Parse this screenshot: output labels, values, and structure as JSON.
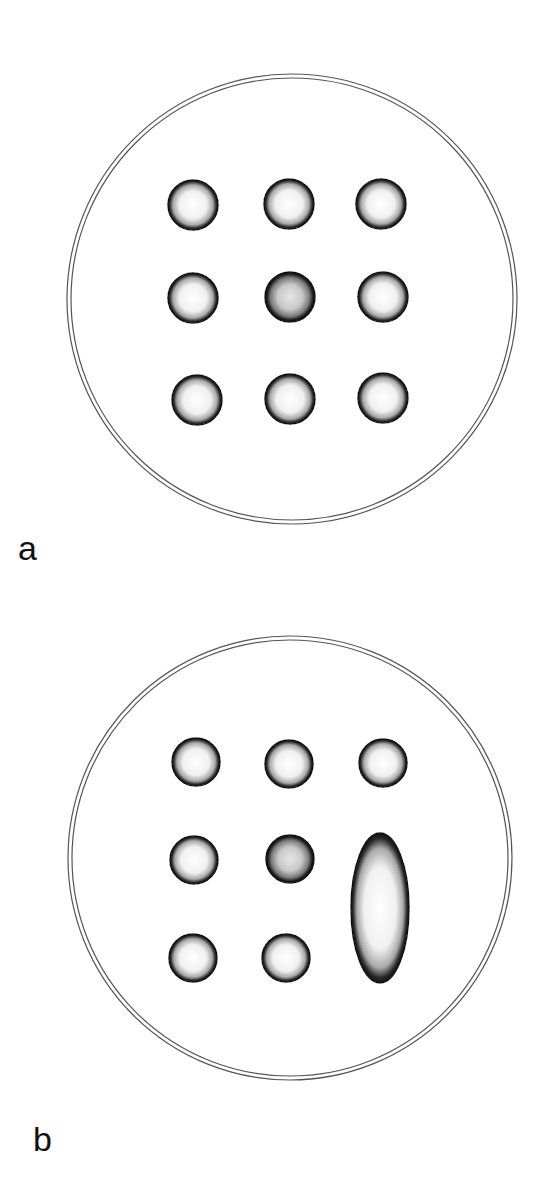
{
  "figure": {
    "panels": [
      {
        "label": "a",
        "dish": {
          "cx": 292,
          "cy": 299,
          "r": 225
        },
        "spots": [
          {
            "cx": 193,
            "cy": 205,
            "rx": 25,
            "ry": 25,
            "shade": "light"
          },
          {
            "cx": 289,
            "cy": 204,
            "rx": 25,
            "ry": 25,
            "shade": "light"
          },
          {
            "cx": 381,
            "cy": 204,
            "rx": 25,
            "ry": 25,
            "shade": "light"
          },
          {
            "cx": 193,
            "cy": 298,
            "rx": 25,
            "ry": 25,
            "shade": "light"
          },
          {
            "cx": 290,
            "cy": 297,
            "rx": 25,
            "ry": 25,
            "shade": "dark"
          },
          {
            "cx": 383,
            "cy": 297,
            "rx": 25,
            "ry": 25,
            "shade": "light"
          },
          {
            "cx": 197,
            "cy": 400,
            "rx": 25,
            "ry": 25,
            "shade": "light"
          },
          {
            "cx": 290,
            "cy": 399,
            "rx": 25,
            "ry": 25,
            "shade": "light"
          },
          {
            "cx": 383,
            "cy": 398,
            "rx": 25,
            "ry": 25,
            "shade": "light"
          }
        ]
      },
      {
        "label": "b",
        "dish": {
          "cx": 290,
          "cy": 858,
          "r": 222
        },
        "spots": [
          {
            "cx": 196,
            "cy": 762,
            "rx": 24,
            "ry": 24,
            "shade": "light"
          },
          {
            "cx": 289,
            "cy": 764,
            "rx": 24,
            "ry": 24,
            "shade": "light"
          },
          {
            "cx": 383,
            "cy": 763,
            "rx": 24,
            "ry": 24,
            "shade": "light"
          },
          {
            "cx": 194,
            "cy": 860,
            "rx": 24,
            "ry": 24,
            "shade": "light"
          },
          {
            "cx": 290,
            "cy": 859,
            "rx": 24,
            "ry": 24,
            "shade": "dark"
          },
          {
            "cx": 380,
            "cy": 908,
            "rx": 29,
            "ry": 75,
            "shade": "light"
          },
          {
            "cx": 193,
            "cy": 958,
            "rx": 24,
            "ry": 24,
            "shade": "light"
          },
          {
            "cx": 286,
            "cy": 958,
            "rx": 24,
            "ry": 24,
            "shade": "light"
          }
        ]
      }
    ],
    "label_positions": [
      {
        "label": "a",
        "x": 18,
        "y": 531
      },
      {
        "label": "b",
        "x": 33,
        "y": 1122
      }
    ],
    "colors": {
      "ink": "#111111",
      "background": "#ffffff",
      "spot_fill": "#f4f4f4"
    }
  }
}
